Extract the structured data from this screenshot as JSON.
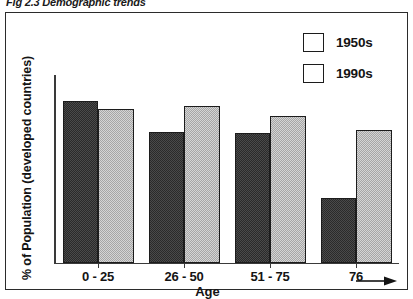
{
  "figure": {
    "caption": "Fig 2.3 Demographic trends"
  },
  "legend": {
    "position": "top-right",
    "entries": [
      {
        "label": "1950s",
        "swatch": "dark-checker-swatch",
        "color": "#4a4a4a"
      },
      {
        "label": "1990s",
        "swatch": "light-checker-swatch",
        "color": "#d5d5d5"
      }
    ]
  },
  "axes": {
    "x_title": "Age",
    "y_title": "% of Population (developed countries)",
    "x_arrow_glyph": "→"
  },
  "chart_data": {
    "type": "bar",
    "title": "Fig 2.3 Demographic trends",
    "xlabel": "Age",
    "ylabel": "% of Population (developed countries)",
    "categories": [
      "0 - 25",
      "26 - 50",
      "51 - 75",
      "76"
    ],
    "series": [
      {
        "name": "1950s",
        "values": [
          100,
          81,
          80,
          40
        ],
        "color": "#4a4a4a"
      },
      {
        "name": "1990s",
        "values": [
          95,
          97,
          91,
          82
        ],
        "color": "#d5d5d5"
      }
    ],
    "ylim": [
      0,
      100
    ],
    "yticks": [],
    "grid": false,
    "legend_position": "top-right"
  }
}
